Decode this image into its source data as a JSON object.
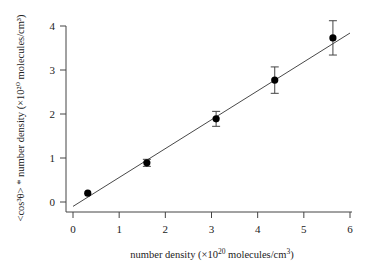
{
  "chart_data": {
    "type": "scatter",
    "title": "",
    "xlabel": "number density (×10",
    "xlabel_sup": "20",
    "xlabel_mid": " molecules/cm",
    "xlabel_sup2": "3",
    "xlabel_end": ")",
    "ylabel": "<cos³θ> * number density (×10²⁰ molecules/cm³)",
    "xlim": [
      0,
      6
    ],
    "ylim": [
      0,
      4
    ],
    "xticks": [
      "0",
      "1",
      "2",
      "3",
      "4",
      "5",
      "6"
    ],
    "yticks": [
      "0",
      "1",
      "2",
      "3",
      "4"
    ],
    "grid": false,
    "series": [
      {
        "name": "data",
        "x": [
          0.32,
          1.6,
          3.1,
          4.37,
          5.63
        ],
        "y": [
          0.2,
          0.89,
          1.89,
          2.77,
          3.73
        ],
        "yerr": [
          0.0,
          0.08,
          0.17,
          0.3,
          0.39
        ]
      },
      {
        "name": "linear fit",
        "type": "line",
        "x": [
          0,
          6
        ],
        "y": [
          -0.1,
          3.84
        ]
      }
    ]
  }
}
